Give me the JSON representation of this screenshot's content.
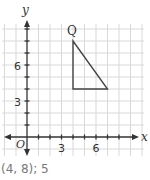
{
  "figure": {
    "axes": {
      "x_label": "x",
      "y_label": "y",
      "origin_label": "O",
      "x_tick_labels": [
        "3",
        "6"
      ],
      "y_tick_labels": [
        "3",
        "6"
      ]
    },
    "triangle": {
      "vertex_label": "Q",
      "vertices": [
        [
          4,
          8
        ],
        [
          4,
          4
        ],
        [
          7,
          4
        ]
      ]
    },
    "colors": {
      "grid": "#d6d6d6",
      "axis": "#333333",
      "shape": "#444444"
    }
  },
  "answer": {
    "text": "(4, 8); 5"
  }
}
